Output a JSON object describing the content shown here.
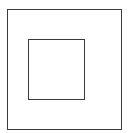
{
  "diagram": {
    "stroke_color": "#3a3a3a",
    "background_color": "#ffffff",
    "shapes": [
      {
        "id": "outer-square",
        "x": 7,
        "y": 9,
        "width": 115,
        "height": 121
      },
      {
        "id": "inner-square",
        "x": 28,
        "y": 39,
        "width": 57,
        "height": 61
      }
    ]
  }
}
